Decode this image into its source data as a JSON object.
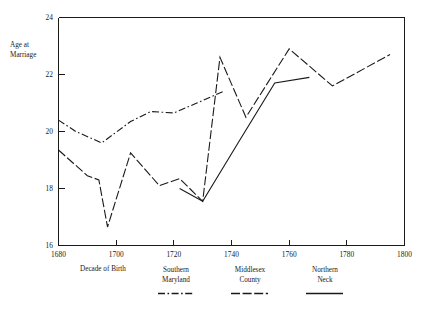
{
  "chart_data": {
    "type": "line",
    "title": "",
    "xlabel": "Decade of Birth",
    "ylabel": "Age at\nMarriage",
    "ylabel_line1": "Age at",
    "ylabel_line2": "Marriage",
    "xlim": [
      1680,
      1800
    ],
    "ylim": [
      16,
      24
    ],
    "xticks": [
      1680,
      1700,
      1720,
      1740,
      1760,
      1780,
      1800
    ],
    "xticklabels": [
      "1680",
      "1700",
      "1720",
      "1740",
      "1760",
      "1780",
      "1800"
    ],
    "yticks": [
      16,
      18,
      20,
      22,
      24
    ],
    "yticklabels": [
      "16",
      "18",
      "20",
      "22",
      "24"
    ],
    "grid": false,
    "legend_position": "below-axes",
    "series": [
      {
        "name": "Southern Maryland",
        "name_line1": "Southern",
        "name_line2": "Maryland",
        "linestyle": "dashdot",
        "color": "#1a1a1a",
        "x": [
          1680,
          1686,
          1695,
          1705,
          1712,
          1720,
          1728,
          1737
        ],
        "y": [
          20.4,
          20.0,
          19.6,
          20.35,
          20.7,
          20.65,
          21.0,
          21.4
        ]
      },
      {
        "name": "Middlesex County",
        "name_line1": "Middlesex",
        "name_line2": "County",
        "linestyle": "dashed",
        "color": "#1a1a1a",
        "x": [
          1680,
          1690,
          1694,
          1697,
          1705,
          1715,
          1722,
          1730,
          1736,
          1745,
          1760,
          1775,
          1795
        ],
        "y": [
          19.35,
          18.45,
          18.3,
          16.65,
          19.25,
          18.1,
          18.35,
          17.55,
          22.6,
          20.5,
          22.9,
          21.6,
          22.7
        ]
      },
      {
        "name": "Northern Neck",
        "name_line1": "Northern",
        "name_line2": "Neck",
        "linestyle": "solid",
        "color": "#1a1a1a",
        "x": [
          1722,
          1730,
          1742,
          1755,
          1767
        ],
        "y": [
          18.0,
          17.55,
          19.55,
          21.7,
          21.9
        ]
      }
    ]
  },
  "axis": {
    "y_label_line1": "Age at",
    "y_label_line2": "Marriage",
    "x_label": "Decade of Birth"
  },
  "ticks": {
    "y": [
      "24",
      "22",
      "20",
      "18",
      "16"
    ],
    "x": [
      "1680",
      "1700",
      "1720",
      "1740",
      "1760",
      "1780",
      "1800"
    ]
  },
  "legend": {
    "entries": [
      {
        "line1": "Southern",
        "line2": "Maryland",
        "style": "dashdot"
      },
      {
        "line1": "Middlesex",
        "line2": "County",
        "style": "dashed"
      },
      {
        "line1": "Northern",
        "line2": "Neck",
        "style": "solid"
      }
    ]
  },
  "colors": {
    "ink": "#1a1a1a",
    "background": "#ffffff"
  }
}
